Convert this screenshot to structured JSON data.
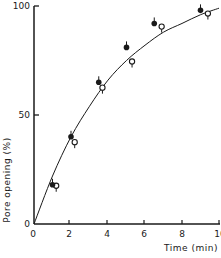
{
  "chart_data": {
    "type": "scatter",
    "title": "",
    "xlabel": "Time (min)",
    "ylabel": "Pore opening (%)",
    "xlim": [
      0,
      10
    ],
    "ylim": [
      0,
      100
    ],
    "x_ticks": [
      "0",
      "2",
      "4",
      "6",
      "8",
      "10"
    ],
    "y_ticks": [
      "0",
      "50",
      "100"
    ],
    "grid": false,
    "legend": null,
    "series": [
      {
        "name": "filled circles",
        "marker": "filled-circle",
        "x": [
          1,
          2,
          3.5,
          5,
          6.5,
          9
        ],
        "y": [
          18,
          40,
          65,
          81,
          92,
          98
        ]
      },
      {
        "name": "open circles",
        "marker": "open-circle",
        "x": [
          1.2,
          2.2,
          3.7,
          5.3,
          6.9,
          9.4
        ],
        "y": [
          18,
          38,
          63,
          75,
          91,
          97
        ]
      }
    ],
    "fitted_curve": {
      "type": "saturating",
      "x": [
        0,
        1,
        2,
        3,
        4,
        5,
        6,
        7,
        8,
        9,
        10
      ],
      "y": [
        0,
        22,
        40,
        54,
        66,
        75,
        82,
        88,
        92,
        96,
        99
      ]
    }
  }
}
